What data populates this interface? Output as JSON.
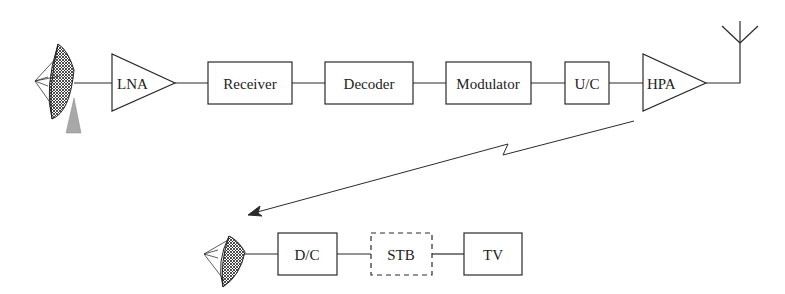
{
  "diagram": {
    "title": "",
    "uplink_chain": [
      {
        "id": "dish-uplink",
        "kind": "dish"
      },
      {
        "id": "lna",
        "kind": "amplifier",
        "label": "LNA"
      },
      {
        "id": "receiver",
        "kind": "box",
        "label": "Receiver"
      },
      {
        "id": "decoder",
        "kind": "box",
        "label": "Decoder"
      },
      {
        "id": "modulator",
        "kind": "box",
        "label": "Modulator"
      },
      {
        "id": "upconverter",
        "kind": "box",
        "label": "U/C"
      },
      {
        "id": "hpa",
        "kind": "amplifier",
        "label": "HPA"
      },
      {
        "id": "antenna",
        "kind": "antenna"
      }
    ],
    "downlink_chain": [
      {
        "id": "dish-downlink",
        "kind": "dish"
      },
      {
        "id": "downconverter",
        "kind": "box",
        "label": "D/C"
      },
      {
        "id": "stb",
        "kind": "dashed-box",
        "label": "STB"
      },
      {
        "id": "tv",
        "kind": "box",
        "label": "TV"
      }
    ],
    "link": {
      "from": "hpa",
      "to": "dish-downlink",
      "style": "wireless-zigzag-arrow"
    },
    "colors": {
      "line": "#2a2a2a",
      "mast": "#a8a8a8",
      "background": "#ffffff"
    }
  }
}
